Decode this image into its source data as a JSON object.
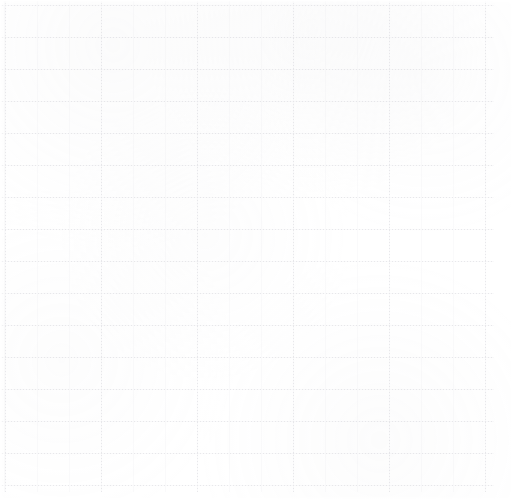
{
  "canvas": {
    "width": 513,
    "height": 500,
    "background_color": "#ffffff",
    "content_description": "blank graph paper grid",
    "text_content": ""
  },
  "grid": {
    "cell_width": 32,
    "cell_height": 32,
    "origin_x": 5,
    "origin_y": 5,
    "vertical_line_count": 16,
    "horizontal_line_count": 16,
    "line_color": "#dcdcdf",
    "line_color_faint": "#e9e9ec",
    "line_width": 1,
    "line_style_major": "solid",
    "line_style_minor": "dotted",
    "dot_period": 3,
    "right_margin": 19,
    "bottom_margin": 8
  },
  "labels": {
    "axis_x": "",
    "axis_y": "",
    "tick_labels_x": [],
    "tick_labels_y": [],
    "annotations": []
  }
}
